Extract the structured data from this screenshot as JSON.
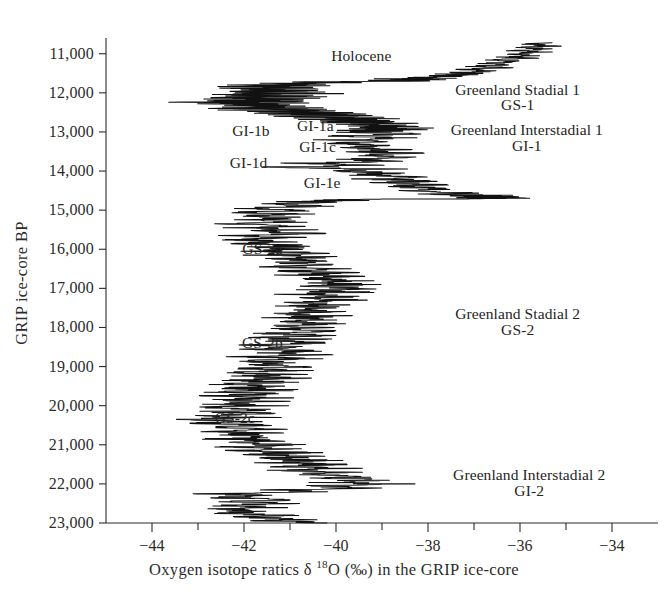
{
  "figure": {
    "background_color": "#ffffff",
    "trace_color": "#111111",
    "axis_color": "#2b2b2b",
    "text_color": "#242424"
  },
  "axes": {
    "y_title": "GRIP ice-core BP",
    "x_title_parts": {
      "lead": "Oxygen isotope ratics ",
      "delta": "δ ",
      "mass": "18",
      "element": "O (‰) in the GRIP ice-core"
    },
    "x_title_plain": "Oxygen isotope ratics δ 18O (‰) in the GRIP ice-core",
    "y_tick_labels": [
      "11,000",
      "12,000",
      "13,000",
      "14,000",
      "15,000",
      "16,000",
      "17,000",
      "18,000",
      "19,000",
      "20,000",
      "21,000",
      "22,000",
      "23,000"
    ],
    "x_tick_labels": [
      "−44",
      "",
      "−42",
      "",
      "−40",
      "",
      "−38",
      "",
      "−36",
      "",
      "−34"
    ]
  },
  "annotations": [
    {
      "id": "holocene",
      "text": "Holocene",
      "x": -39.45,
      "y": 11080,
      "align": "center"
    },
    {
      "id": "gs1-line1",
      "text": "Greenland Stadial 1",
      "x": -36.05,
      "y": 11950,
      "align": "center"
    },
    {
      "id": "gs1-line2",
      "text": "GS-1",
      "x": -36.05,
      "y": 12330,
      "align": "center"
    },
    {
      "id": "gi1b",
      "text": "GI-1b",
      "x": -41.85,
      "y": 13000,
      "align": "center"
    },
    {
      "id": "gi1a",
      "text": "GI-1a",
      "x": -40.45,
      "y": 12880,
      "align": "center"
    },
    {
      "id": "gi1c",
      "text": "GI-1c",
      "x": -40.4,
      "y": 13420,
      "align": "center"
    },
    {
      "id": "gi1d",
      "text": "GI-1d",
      "x": -41.9,
      "y": 13820,
      "align": "center"
    },
    {
      "id": "gi1e",
      "text": "GI-1e",
      "x": -40.3,
      "y": 14330,
      "align": "center"
    },
    {
      "id": "gi1-line1",
      "text": "Greenland Interstadial 1",
      "x": -35.85,
      "y": 12980,
      "align": "center"
    },
    {
      "id": "gi1-line2",
      "text": "GI-1",
      "x": -35.85,
      "y": 13380,
      "align": "center"
    },
    {
      "id": "gs2a",
      "text": "GS-2a",
      "x": -41.6,
      "y": 16010,
      "align": "center"
    },
    {
      "id": "gs2b",
      "text": "GS-2b",
      "x": -41.6,
      "y": 18430,
      "align": "center"
    },
    {
      "id": "gs2c",
      "text": "GS-2c",
      "x": -42.2,
      "y": 20340,
      "align": "center"
    },
    {
      "id": "gs2-line1",
      "text": "Greenland Stadial 2",
      "x": -36.05,
      "y": 17680,
      "align": "center"
    },
    {
      "id": "gs2-line2",
      "text": "GS-2",
      "x": -36.05,
      "y": 18080,
      "align": "center"
    },
    {
      "id": "gi2-line1",
      "text": "Greenland Interstadial 2",
      "x": -35.8,
      "y": 21800,
      "align": "center"
    },
    {
      "id": "gi2-line2",
      "text": "GI-2",
      "x": -35.8,
      "y": 22200,
      "align": "center"
    }
  ],
  "chart_data": {
    "type": "line",
    "orientation": "vertical",
    "title": "",
    "xlabel": "Oxygen isotope ratics δ 18O (‰) in the GRIP ice-core",
    "ylabel": "GRIP ice-core BP",
    "xlim": [
      -45,
      -33
    ],
    "ylim": [
      23000,
      10700
    ],
    "y_inverted": true,
    "grid": false,
    "legend": null,
    "x_ticks": [
      -44,
      -43,
      -42,
      -41,
      -40,
      -39,
      -38,
      -37,
      -36,
      -35,
      -34
    ],
    "x_major_ticks": [
      -44,
      -42,
      -40,
      -38,
      -36,
      -34
    ],
    "y_ticks": [
      11000,
      12000,
      13000,
      14000,
      15000,
      16000,
      17000,
      18000,
      19000,
      20000,
      21000,
      22000,
      23000
    ],
    "series_name": "GRIP δ18O",
    "comment": "y = GRIP ice-core age (years BP), x = delta-18O permil. Pairs listed [age, d18O] from young (top) to old (bottom).",
    "points": [
      [
        10720,
        -35.3
      ],
      [
        10760,
        -35.8
      ],
      [
        10800,
        -35.2
      ],
      [
        10840,
        -35.9
      ],
      [
        10880,
        -35.4
      ],
      [
        10920,
        -36.1
      ],
      [
        10960,
        -35.5
      ],
      [
        11000,
        -36.2
      ],
      [
        11040,
        -35.6
      ],
      [
        11080,
        -36.3
      ],
      [
        11120,
        -35.8
      ],
      [
        11160,
        -36.5
      ],
      [
        11200,
        -36.0
      ],
      [
        11240,
        -36.8
      ],
      [
        11280,
        -36.2
      ],
      [
        11320,
        -37.0
      ],
      [
        11360,
        -36.4
      ],
      [
        11400,
        -37.2
      ],
      [
        11440,
        -36.6
      ],
      [
        11480,
        -37.4
      ],
      [
        11500,
        -36.9
      ],
      [
        11520,
        -37.6
      ],
      [
        11540,
        -37.1
      ],
      [
        11560,
        -38.0
      ],
      [
        11580,
        -37.3
      ],
      [
        11600,
        -38.4
      ],
      [
        11620,
        -37.6
      ],
      [
        11640,
        -38.7
      ],
      [
        11660,
        -38.0
      ],
      [
        11680,
        -39.0
      ],
      [
        11700,
        -38.3
      ],
      [
        11720,
        -41.2
      ],
      [
        11740,
        -39.6
      ],
      [
        11760,
        -41.8
      ],
      [
        11780,
        -40.2
      ],
      [
        11800,
        -42.2
      ],
      [
        11820,
        -40.4
      ],
      [
        11840,
        -42.4
      ],
      [
        11860,
        -40.6
      ],
      [
        11880,
        -42.6
      ],
      [
        11900,
        -40.5
      ],
      [
        11920,
        -42.5
      ],
      [
        11940,
        -40.3
      ],
      [
        11960,
        -42.7
      ],
      [
        11980,
        -40.6
      ],
      [
        12000,
        -42.4
      ],
      [
        12020,
        -40.4
      ],
      [
        12040,
        -42.6
      ],
      [
        12060,
        -40.7
      ],
      [
        12080,
        -42.3
      ],
      [
        12100,
        -40.5
      ],
      [
        12120,
        -42.8
      ],
      [
        12140,
        -40.8
      ],
      [
        12160,
        -42.5
      ],
      [
        12180,
        -40.6
      ],
      [
        12200,
        -42.9
      ],
      [
        12220,
        -40.9
      ],
      [
        12240,
        -43.2
      ],
      [
        12260,
        -41.0
      ],
      [
        12280,
        -42.8
      ],
      [
        12300,
        -40.7
      ],
      [
        12320,
        -42.5
      ],
      [
        12340,
        -40.5
      ],
      [
        12360,
        -42.4
      ],
      [
        12380,
        -40.6
      ],
      [
        12400,
        -42.2
      ],
      [
        12420,
        -40.3
      ],
      [
        12440,
        -42.0
      ],
      [
        12460,
        -40.1
      ],
      [
        12480,
        -41.8
      ],
      [
        12500,
        -39.9
      ],
      [
        12520,
        -41.6
      ],
      [
        12540,
        -39.7
      ],
      [
        12560,
        -41.4
      ],
      [
        12580,
        -39.5
      ],
      [
        12600,
        -41.2
      ],
      [
        12620,
        -39.3
      ],
      [
        12640,
        -40.8
      ],
      [
        12660,
        -39.1
      ],
      [
        12680,
        -40.5
      ],
      [
        12700,
        -38.9
      ],
      [
        12720,
        -40.2
      ],
      [
        12740,
        -38.8
      ],
      [
        12760,
        -40.0
      ],
      [
        12780,
        -38.7
      ],
      [
        12800,
        -39.8
      ],
      [
        12820,
        -38.5
      ],
      [
        12840,
        -39.6
      ],
      [
        12860,
        -38.4
      ],
      [
        12880,
        -39.4
      ],
      [
        12900,
        -38.3
      ],
      [
        12920,
        -39.5
      ],
      [
        12940,
        -38.4
      ],
      [
        12960,
        -39.7
      ],
      [
        12980,
        -38.5
      ],
      [
        13000,
        -39.6
      ],
      [
        13050,
        -38.6
      ],
      [
        13100,
        -39.8
      ],
      [
        13150,
        -38.7
      ],
      [
        13200,
        -40.0
      ],
      [
        13250,
        -38.9
      ],
      [
        13300,
        -40.2
      ],
      [
        13350,
        -38.8
      ],
      [
        13400,
        -39.9
      ],
      [
        13450,
        -38.6
      ],
      [
        13500,
        -39.4
      ],
      [
        13550,
        -38.4
      ],
      [
        13600,
        -39.6
      ],
      [
        13650,
        -38.5
      ],
      [
        13700,
        -39.8
      ],
      [
        13750,
        -38.6
      ],
      [
        13800,
        -41.0
      ],
      [
        13850,
        -39.2
      ],
      [
        13900,
        -41.4
      ],
      [
        13950,
        -39.0
      ],
      [
        14000,
        -40.2
      ],
      [
        14050,
        -38.6
      ],
      [
        14100,
        -39.5
      ],
      [
        14150,
        -38.3
      ],
      [
        14200,
        -39.2
      ],
      [
        14250,
        -38.1
      ],
      [
        14300,
        -38.9
      ],
      [
        14350,
        -37.9
      ],
      [
        14400,
        -38.6
      ],
      [
        14450,
        -37.6
      ],
      [
        14500,
        -38.2
      ],
      [
        14550,
        -37.3
      ],
      [
        14600,
        -37.8
      ],
      [
        14620,
        -36.3
      ],
      [
        14640,
        -37.2
      ],
      [
        14660,
        -36.0
      ],
      [
        14680,
        -36.8
      ],
      [
        14700,
        -35.9
      ],
      [
        14720,
        -38.9
      ],
      [
        14740,
        -40.4
      ],
      [
        14760,
        -39.6
      ],
      [
        14780,
        -41.0
      ],
      [
        14800,
        -40.2
      ],
      [
        14850,
        -41.4
      ],
      [
        14900,
        -40.4
      ],
      [
        14950,
        -41.8
      ],
      [
        15000,
        -40.6
      ],
      [
        15050,
        -42.0
      ],
      [
        15100,
        -40.8
      ],
      [
        15150,
        -41.9
      ],
      [
        15200,
        -40.7
      ],
      [
        15250,
        -42.1
      ],
      [
        15300,
        -40.9
      ],
      [
        15350,
        -42.3
      ],
      [
        15400,
        -41.0
      ],
      [
        15450,
        -42.0
      ],
      [
        15500,
        -40.8
      ],
      [
        15550,
        -41.8
      ],
      [
        15600,
        -40.6
      ],
      [
        15650,
        -42.2
      ],
      [
        15700,
        -40.9
      ],
      [
        15750,
        -42.4
      ],
      [
        15800,
        -41.1
      ],
      [
        15850,
        -42.0
      ],
      [
        15900,
        -40.7
      ],
      [
        15950,
        -41.6
      ],
      [
        16000,
        -40.4
      ],
      [
        16050,
        -41.8
      ],
      [
        16100,
        -40.5
      ],
      [
        16150,
        -41.5
      ],
      [
        16200,
        -40.2
      ],
      [
        16250,
        -41.4
      ],
      [
        16300,
        -40.1
      ],
      [
        16350,
        -41.2
      ],
      [
        16400,
        -40.0
      ],
      [
        16450,
        -41.3
      ],
      [
        16500,
        -40.1
      ],
      [
        16550,
        -41.0
      ],
      [
        16600,
        -39.8
      ],
      [
        16650,
        -40.9
      ],
      [
        16700,
        -39.7
      ],
      [
        16750,
        -40.8
      ],
      [
        16800,
        -39.6
      ],
      [
        16850,
        -40.6
      ],
      [
        16900,
        -39.5
      ],
      [
        16950,
        -40.4
      ],
      [
        17000,
        -39.4
      ],
      [
        17050,
        -40.6
      ],
      [
        17100,
        -39.6
      ],
      [
        17150,
        -40.8
      ],
      [
        17200,
        -39.7
      ],
      [
        17250,
        -40.5
      ],
      [
        17300,
        -39.5
      ],
      [
        17350,
        -40.7
      ],
      [
        17400,
        -39.8
      ],
      [
        17450,
        -40.9
      ],
      [
        17500,
        -39.9
      ],
      [
        17550,
        -41.0
      ],
      [
        17600,
        -40.0
      ],
      [
        17650,
        -41.2
      ],
      [
        17700,
        -40.1
      ],
      [
        17750,
        -41.1
      ],
      [
        17800,
        -40.0
      ],
      [
        17850,
        -41.3
      ],
      [
        17900,
        -40.2
      ],
      [
        17950,
        -41.4
      ],
      [
        18000,
        -40.3
      ],
      [
        18050,
        -41.2
      ],
      [
        18100,
        -40.1
      ],
      [
        18150,
        -41.5
      ],
      [
        18200,
        -40.4
      ],
      [
        18250,
        -41.6
      ],
      [
        18300,
        -40.5
      ],
      [
        18350,
        -41.4
      ],
      [
        18400,
        -40.3
      ],
      [
        18450,
        -41.7
      ],
      [
        18500,
        -40.6
      ],
      [
        18550,
        -41.8
      ],
      [
        18600,
        -40.7
      ],
      [
        18650,
        -41.6
      ],
      [
        18700,
        -40.5
      ],
      [
        18750,
        -41.9
      ],
      [
        18800,
        -40.8
      ],
      [
        18850,
        -42.0
      ],
      [
        18900,
        -40.9
      ],
      [
        18950,
        -41.8
      ],
      [
        19000,
        -40.7
      ],
      [
        19050,
        -42.1
      ],
      [
        19100,
        -41.0
      ],
      [
        19150,
        -42.2
      ],
      [
        19200,
        -41.1
      ],
      [
        19250,
        -42.0
      ],
      [
        19300,
        -40.9
      ],
      [
        19350,
        -42.3
      ],
      [
        19400,
        -41.2
      ],
      [
        19450,
        -42.4
      ],
      [
        19500,
        -41.3
      ],
      [
        19550,
        -42.2
      ],
      [
        19600,
        -41.1
      ],
      [
        19650,
        -42.5
      ],
      [
        19700,
        -41.4
      ],
      [
        19750,
        -42.6
      ],
      [
        19800,
        -41.5
      ],
      [
        19850,
        -42.4
      ],
      [
        19900,
        -41.3
      ],
      [
        19950,
        -42.7
      ],
      [
        20000,
        -41.6
      ],
      [
        20050,
        -42.8
      ],
      [
        20100,
        -41.7
      ],
      [
        20150,
        -42.6
      ],
      [
        20200,
        -41.5
      ],
      [
        20250,
        -42.9
      ],
      [
        20300,
        -41.8
      ],
      [
        20350,
        -43.0
      ],
      [
        20400,
        -41.9
      ],
      [
        20450,
        -42.8
      ],
      [
        20500,
        -41.7
      ],
      [
        20550,
        -42.6
      ],
      [
        20600,
        -41.5
      ],
      [
        20650,
        -42.7
      ],
      [
        20700,
        -41.6
      ],
      [
        20750,
        -42.4
      ],
      [
        20800,
        -41.3
      ],
      [
        20850,
        -42.5
      ],
      [
        20900,
        -41.4
      ],
      [
        20950,
        -42.2
      ],
      [
        21000,
        -41.1
      ],
      [
        21050,
        -42.3
      ],
      [
        21100,
        -41.2
      ],
      [
        21150,
        -42.0
      ],
      [
        21200,
        -40.9
      ],
      [
        21250,
        -41.8
      ],
      [
        21300,
        -40.6
      ],
      [
        21350,
        -41.6
      ],
      [
        21400,
        -40.4
      ],
      [
        21450,
        -41.4
      ],
      [
        21500,
        -40.2
      ],
      [
        21550,
        -41.2
      ],
      [
        21600,
        -40.0
      ],
      [
        21650,
        -41.0
      ],
      [
        21700,
        -39.8
      ],
      [
        21750,
        -40.6
      ],
      [
        21800,
        -39.4
      ],
      [
        21850,
        -40.2
      ],
      [
        21900,
        -39.0
      ],
      [
        21950,
        -40.4
      ],
      [
        22000,
        -38.9
      ],
      [
        22050,
        -40.6
      ],
      [
        22100,
        -39.2
      ],
      [
        22150,
        -41.6
      ],
      [
        22200,
        -40.4
      ],
      [
        22250,
        -43.0
      ],
      [
        22300,
        -41.6
      ],
      [
        22350,
        -42.4
      ],
      [
        22400,
        -41.2
      ],
      [
        22450,
        -42.2
      ],
      [
        22500,
        -41.0
      ],
      [
        22550,
        -42.6
      ],
      [
        22600,
        -41.4
      ],
      [
        22650,
        -42.8
      ],
      [
        22700,
        -41.6
      ],
      [
        22750,
        -42.4
      ],
      [
        22800,
        -41.2
      ],
      [
        22850,
        -41.8
      ],
      [
        22900,
        -40.6
      ],
      [
        22950,
        -41.4
      ],
      [
        23000,
        -40.2
      ]
    ]
  }
}
